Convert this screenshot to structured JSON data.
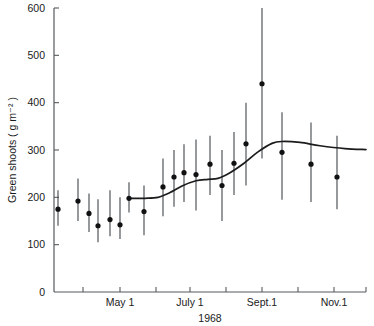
{
  "chart_data": {
    "type": "scatter",
    "title": "",
    "xlabel": "1968",
    "ylabel": "Green shoots ( g m⁻² )",
    "ylim": [
      0,
      600
    ],
    "ytick_values": [
      0,
      100,
      200,
      300,
      400,
      500,
      600
    ],
    "ytick_labels": [
      "0",
      "100",
      "200",
      "300",
      "400",
      "500",
      "600"
    ],
    "xtick_labels": [
      "May 1",
      "July 1",
      "Sept.1",
      "Nov.1"
    ],
    "xtick_label_positions": [
      120,
      190,
      262,
      334
    ],
    "xtick_positions": [
      83,
      120,
      156,
      190,
      226,
      262,
      298,
      334
    ],
    "grid": false,
    "legend": null,
    "x_axis_units": "date (1968 growing season)",
    "error_bar_note": "vertical bars show range / standard error about each mean",
    "points": [
      {
        "x": 58,
        "y": 175,
        "ylow": 140,
        "yhigh": 215
      },
      {
        "x": 78,
        "y": 192,
        "ylow": 150,
        "yhigh": 240
      },
      {
        "x": 89,
        "y": 166,
        "ylow": 127,
        "yhigh": 208
      },
      {
        "x": 98,
        "y": 140,
        "ylow": 105,
        "yhigh": 196
      },
      {
        "x": 110,
        "y": 153,
        "ylow": 118,
        "yhigh": 215
      },
      {
        "x": 120,
        "y": 142,
        "ylow": 112,
        "yhigh": 200
      },
      {
        "x": 129,
        "y": 198,
        "ylow": 168,
        "yhigh": 232
      },
      {
        "x": 144,
        "y": 170,
        "ylow": 120,
        "yhigh": 225
      },
      {
        "x": 163,
        "y": 222,
        "ylow": 160,
        "yhigh": 282
      },
      {
        "x": 174,
        "y": 243,
        "ylow": 180,
        "yhigh": 300
      },
      {
        "x": 184,
        "y": 252,
        "ylow": 190,
        "yhigh": 312
      },
      {
        "x": 196,
        "y": 248,
        "ylow": 172,
        "yhigh": 322
      },
      {
        "x": 210,
        "y": 270,
        "ylow": 205,
        "yhigh": 330
      },
      {
        "x": 222,
        "y": 225,
        "ylow": 150,
        "yhigh": 300
      },
      {
        "x": 234,
        "y": 272,
        "ylow": 205,
        "yhigh": 338
      },
      {
        "x": 246,
        "y": 313,
        "ylow": 225,
        "yhigh": 400
      },
      {
        "x": 262,
        "y": 440,
        "ylow": 282,
        "yhigh": 600
      },
      {
        "x": 282,
        "y": 295,
        "ylow": 195,
        "yhigh": 380
      },
      {
        "x": 311,
        "y": 270,
        "ylow": 190,
        "yhigh": 358
      },
      {
        "x": 337,
        "y": 243,
        "ylow": 175,
        "yhigh": 330
      }
    ],
    "fit_curve": [
      {
        "x": 129,
        "y": 198
      },
      {
        "x": 145,
        "y": 198
      },
      {
        "x": 158,
        "y": 200
      },
      {
        "x": 170,
        "y": 210
      },
      {
        "x": 182,
        "y": 224
      },
      {
        "x": 196,
        "y": 235
      },
      {
        "x": 208,
        "y": 238
      },
      {
        "x": 218,
        "y": 240
      },
      {
        "x": 230,
        "y": 252
      },
      {
        "x": 244,
        "y": 272
      },
      {
        "x": 258,
        "y": 296
      },
      {
        "x": 272,
        "y": 314
      },
      {
        "x": 282,
        "y": 318
      },
      {
        "x": 300,
        "y": 316
      },
      {
        "x": 320,
        "y": 309
      },
      {
        "x": 345,
        "y": 303
      },
      {
        "x": 366,
        "y": 301
      }
    ]
  }
}
